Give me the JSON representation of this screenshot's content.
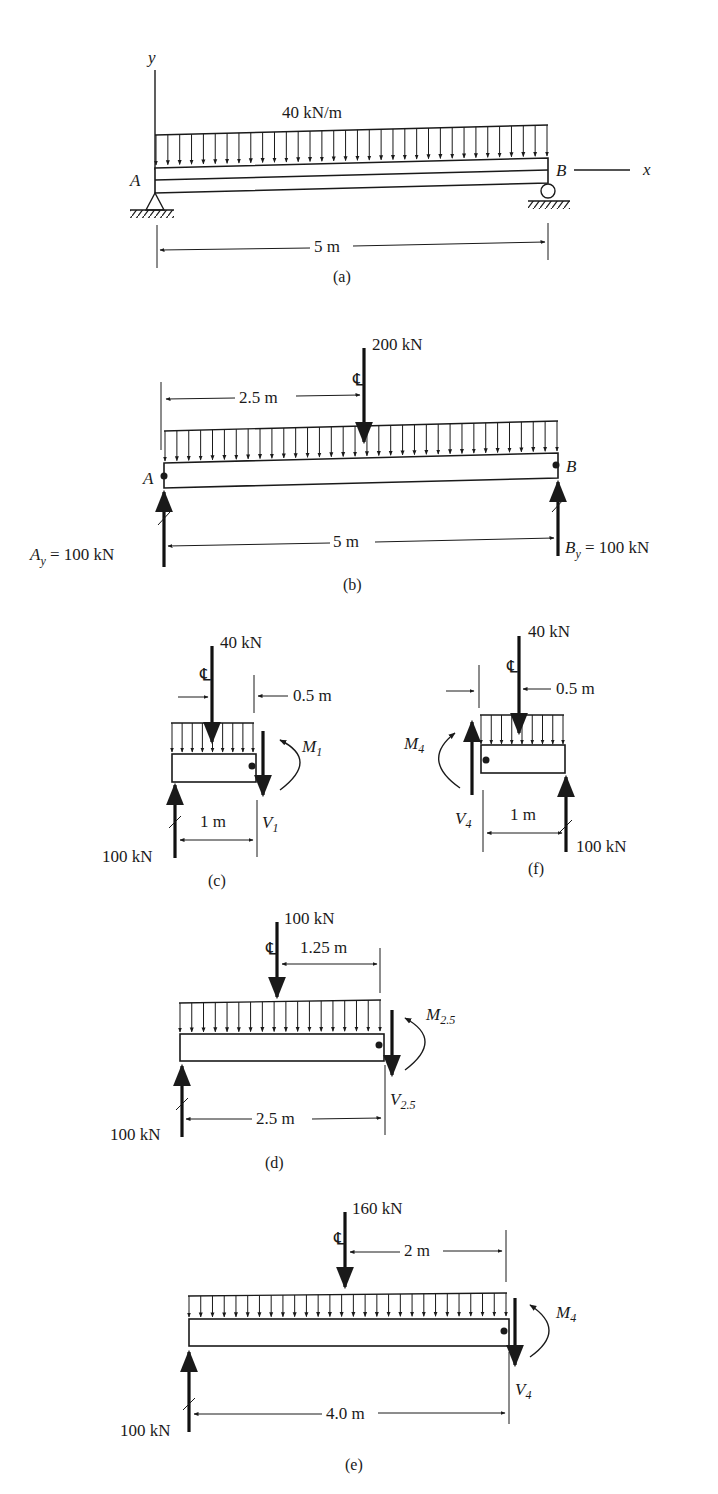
{
  "figure": {
    "panel_a": {
      "caption": "(a)",
      "load_label": "40 kN/m",
      "axis_y": "y",
      "axis_x": "x",
      "point_a": "A",
      "point_b": "B",
      "span": "5 m"
    },
    "panel_b": {
      "caption": "(b)",
      "point_load": "200 kN",
      "centerline_symbol": "℄",
      "offset": "2.5 m",
      "point_a": "A",
      "point_b": "B",
      "span": "5 m",
      "reaction_a": "A",
      "reaction_a_sub": "y",
      "reaction_a_value": " = 100 kN",
      "reaction_b": "B",
      "reaction_b_sub": "y",
      "reaction_b_value": " = 100 kN"
    },
    "panel_c": {
      "caption": "(c)",
      "point_load": "40 kN",
      "offset": "0.5 m",
      "length": "1 m",
      "reaction": "100 kN",
      "moment": "M",
      "moment_sub": "1",
      "shear": "V",
      "shear_sub": "1"
    },
    "panel_f": {
      "caption": "(f)",
      "point_load": "40 kN",
      "offset": "0.5 m",
      "length": "1 m",
      "reaction": "100 kN",
      "moment": "M",
      "moment_sub": "4",
      "shear": "V",
      "shear_sub": "4"
    },
    "panel_d": {
      "caption": "(d)",
      "point_load": "100 kN",
      "offset": "1.25 m",
      "length": "2.5 m",
      "reaction": "100 kN",
      "moment": "M",
      "moment_sub": "2.5",
      "shear": "V",
      "shear_sub": "2.5"
    },
    "panel_e": {
      "caption": "(e)",
      "point_load": "160 kN",
      "offset": "2 m",
      "length": "4.0 m",
      "reaction": "100 kN",
      "moment": "M",
      "moment_sub": "4",
      "shear": "V",
      "shear_sub": "4"
    }
  },
  "colors": {
    "ink": "#1a1a1a",
    "background": "#ffffff"
  }
}
